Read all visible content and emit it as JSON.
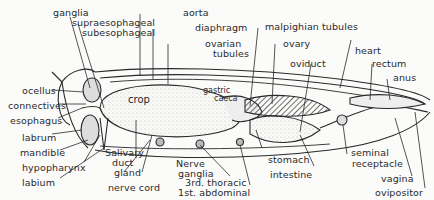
{
  "diagram": {
    "colors": {
      "ink": "#2a2a2a",
      "background": "#fbfbfa",
      "stipple": "#d8d8d4"
    },
    "labels": {
      "ganglia": "ganglia",
      "supraesophageal": "supraesophageal",
      "subesophageal": "subesophageal",
      "aorta": "aorta",
      "diaphragm": "diaphragm",
      "ovarian_tubules_1": "ovarian",
      "ovarian_tubules_2": "tubules",
      "malpighian_tubules": "malpighian tubules",
      "ovary": "ovary",
      "oviduct": "oviduct",
      "heart": "heart",
      "rectum": "rectum",
      "anus": "anus",
      "ocellus": "ocellus",
      "connectives": "connectives",
      "esophagus": "esophagus",
      "labrum": "labrum",
      "mandible": "mandible",
      "hypopharynx": "hypopharynx",
      "labium": "labium",
      "crop": "crop",
      "gastric_caeca_1": "gastric",
      "gastric_caeca_2": "caeca",
      "salivary_1": "Salivary",
      "salivary_duct": "duct",
      "salivary_gland": "gland",
      "nerve_cord": "nerve cord",
      "nerve_ganglia_1": "Nerve",
      "nerve_ganglia_2": "ganglia",
      "third_thoracic": "3rd. thoracic",
      "first_abdominal": "1st. abdominal",
      "stomach": "stomach",
      "intestine": "intestine",
      "seminal_receptacle_1": "seminal",
      "seminal_receptacle_2": "receptacle",
      "vagina": "vagina",
      "ovipositor": "ovipositor"
    }
  }
}
